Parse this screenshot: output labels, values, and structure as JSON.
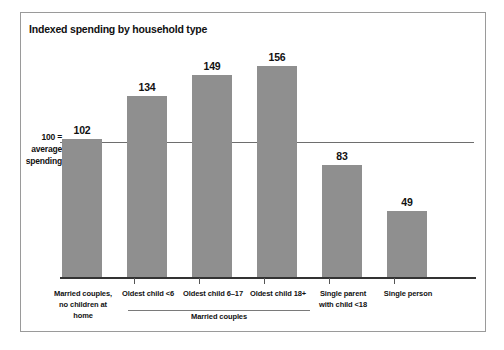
{
  "figure": {
    "title": "Indexed spending by household type",
    "axis_note_lines": [
      "100 =",
      "average",
      "spending"
    ],
    "group_bracket_label": "Married couples",
    "colors": {
      "bar_fill": "#8f8f8f",
      "baseline": "#333333",
      "reference_line": "#6e6e6e",
      "frame_border": "#9a9a9a",
      "text": "#111111",
      "background": "#ffffff"
    }
  },
  "chart_data": {
    "type": "bar",
    "title": "Indexed spending by household type",
    "xlabel": "",
    "ylabel": "",
    "ylim": [
      0,
      175
    ],
    "grid": false,
    "legend": null,
    "reference_line": {
      "value": 100,
      "label": "100 = average spending"
    },
    "categories": [
      "Married couples, no children at home",
      "Oldest child <6",
      "Oldest child 6–17",
      "Oldest child 18+",
      "Single parent with child <18",
      "Single person"
    ],
    "category_lines": [
      [
        "Married couples,",
        "no children at home"
      ],
      [
        "Oldest child <6"
      ],
      [
        "Oldest child 6–17"
      ],
      [
        "Oldest child 18+"
      ],
      [
        "Single parent",
        "with child <18"
      ],
      [
        "Single person"
      ]
    ],
    "values": [
      102,
      134,
      149,
      156,
      83,
      49
    ],
    "value_labels": [
      "102",
      "134",
      "149",
      "156",
      "83",
      "49"
    ],
    "groups": [
      {
        "label": "Married couples",
        "category_indices": [
          1,
          2,
          3
        ]
      }
    ]
  }
}
